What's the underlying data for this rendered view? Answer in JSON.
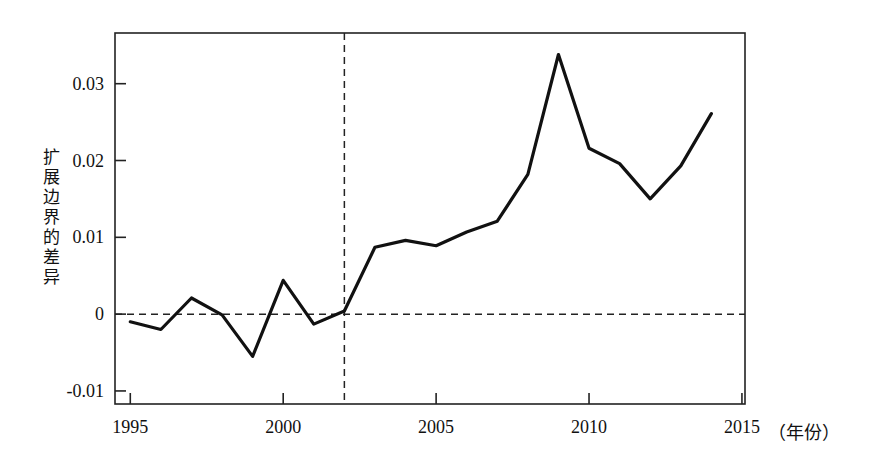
{
  "chart_data": {
    "type": "line",
    "title": "",
    "xlabel": "年份",
    "ylabel": "扩展边界的差异",
    "x": [
      1995,
      1996,
      1997,
      1998,
      1999,
      2000,
      2001,
      2002,
      2003,
      2004,
      2005,
      2006,
      2007,
      2008,
      2009,
      2010,
      2011,
      2012,
      2013,
      2014
    ],
    "values": [
      -0.001,
      -0.002,
      0.0021,
      -0.0001,
      -0.0055,
      0.0044,
      -0.0013,
      0.0004,
      0.0087,
      0.0096,
      0.0089,
      0.0107,
      0.0121,
      0.0182,
      0.0338,
      0.0216,
      0.0196,
      0.015,
      0.0193,
      0.0261
    ],
    "series": [
      {
        "name": "扩展边界的差异",
        "values": [
          -0.001,
          -0.002,
          0.0021,
          -0.0001,
          -0.0055,
          0.0044,
          -0.0013,
          0.0004,
          0.0087,
          0.0096,
          0.0089,
          0.0107,
          0.0121,
          0.0182,
          0.0338,
          0.0216,
          0.0196,
          0.015,
          0.0193,
          0.0261
        ]
      }
    ],
    "xlim": [
      1994.5,
      2015.1
    ],
    "ylim": [
      -0.0117,
      0.0366
    ],
    "xticks": [
      1995,
      2000,
      2005,
      2010,
      2015
    ],
    "xtick_labels": [
      "1995",
      "2000",
      "2005",
      "2010",
      "2015"
    ],
    "yticks": [
      -0.01,
      0,
      0.01,
      0.02,
      0.03
    ],
    "ytick_labels": [
      "-0.01",
      "0",
      "0.01",
      "0.02",
      "0.03"
    ],
    "grid": false,
    "legend": null,
    "annotations": [
      {
        "type": "vline",
        "name": "policy-year-marker",
        "x": 2002,
        "style": "dashed"
      },
      {
        "type": "hline",
        "name": "zero-reference-line",
        "y": 0,
        "style": "dashed"
      }
    ],
    "line_color": "#111111",
    "line_width": 3.2,
    "axis_color": "#222222"
  },
  "axes": {
    "y_label_chars": [
      "扩",
      "展",
      "边",
      "界",
      "的",
      "差",
      "异"
    ],
    "x_unit_label": "（年份）"
  }
}
